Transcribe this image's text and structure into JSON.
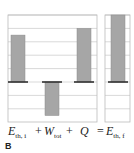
{
  "chart_data": {
    "type": "bar",
    "title": "",
    "xlabel": "",
    "ylabel": "",
    "ylim": [
      -3,
      5
    ],
    "grid": true,
    "categories": [
      "E_th,i",
      "W_tot",
      "Q",
      "E_th,f"
    ],
    "values": [
      3.5,
      -2.5,
      4,
      5
    ],
    "labels": [
      {
        "main": "E",
        "sub": "th, i"
      },
      {
        "main": "W",
        "sub": "tot"
      },
      {
        "main": "Q",
        "sub": ""
      },
      {
        "main": "E",
        "sub": "th, f"
      }
    ],
    "operators": [
      "+",
      "+",
      "="
    ],
    "bar_color": "#a6a6a6",
    "baseline_color": "#333333",
    "grid_color": "#c8c8c8"
  },
  "panel_letter": "B"
}
